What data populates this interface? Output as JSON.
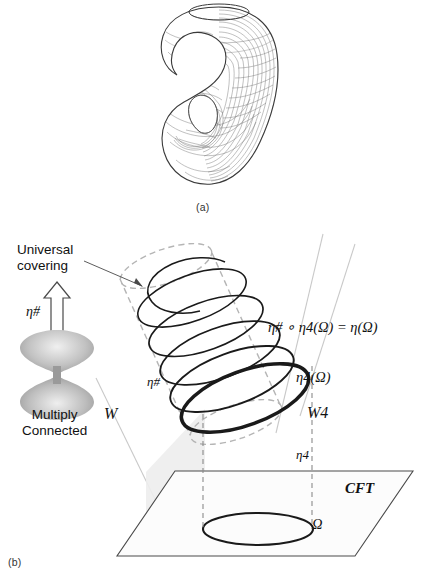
{
  "figure": {
    "panels": [
      {
        "id": "a",
        "caption": "(a)",
        "content_name": "klein-bottle-wireframe-surface"
      },
      {
        "id": "b",
        "caption": "(b)",
        "content_name": "universal-covering-cft-diagram"
      }
    ]
  },
  "panel_a": {
    "caption": "(a)",
    "surface_label": "wireframe-klein-bottle"
  },
  "panel_b": {
    "caption": "(b)",
    "labels": {
      "universal_covering_line1": "Universal",
      "universal_covering_line2": "covering",
      "multiply_connected_line1": "Multiply",
      "multiply_connected_line2": "Connected",
      "eta_sharp_arrow": "η#",
      "eta_sharp_spiral": "η#",
      "equation_main": "η# ∘ η4(Ω) = η(Ω)",
      "eta4_omega": "η4(Ω)",
      "bulk_W": "W",
      "bulk_W4": "W4",
      "eta4_projection": "η4",
      "boundary_theory": "CFT",
      "omega_region": "Ω"
    }
  },
  "colors": {
    "ink": "#111111",
    "stroke_black": "#1a1a1a",
    "stroke_gray_dashed": "#b0b0b0",
    "stroke_gray_light": "#c9c9c9",
    "plane_fill": "#fbfbfb",
    "wedge_fill": "#ededed",
    "hyperboloid_dark": "#8c8c8c",
    "hyperboloid_light": "#dcdcdc",
    "background": "#ffffff"
  }
}
